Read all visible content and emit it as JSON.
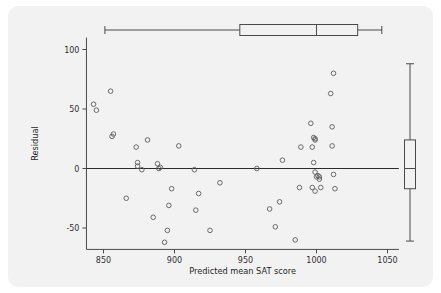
{
  "figure": {
    "background_color": "#f2f2f2",
    "page_color": "#ffffff",
    "point_color": "#5c5c5c",
    "axis_color": "#4a4a4a"
  },
  "chart_data": {
    "type": "scatter",
    "title": "",
    "xlabel": "Predicted mean SAT score",
    "ylabel": "Residual",
    "xlim": [
      838,
      1058
    ],
    "ylim": [
      -68,
      110
    ],
    "xticks": [
      850,
      900,
      950,
      1000,
      1050
    ],
    "xtick_labels": [
      "850",
      "900",
      "950",
      "1000",
      "1050"
    ],
    "yticks": [
      100,
      50,
      0,
      -50
    ],
    "ytick_labels": [
      "100",
      "50",
      "0",
      "-50"
    ],
    "grid": false,
    "legend": null,
    "reference_line_y": 0,
    "points": [
      [
        843,
        54
      ],
      [
        845,
        49
      ],
      [
        855,
        65
      ],
      [
        856,
        27
      ],
      [
        857,
        29
      ],
      [
        866,
        -25
      ],
      [
        873,
        18
      ],
      [
        874,
        5
      ],
      [
        874,
        2
      ],
      [
        877,
        -1
      ],
      [
        881,
        24
      ],
      [
        885,
        -41
      ],
      [
        888,
        4
      ],
      [
        889,
        0
      ],
      [
        890,
        1
      ],
      [
        893,
        -62
      ],
      [
        895,
        -52
      ],
      [
        896,
        -31
      ],
      [
        898,
        -17
      ],
      [
        903,
        19
      ],
      [
        914,
        -1
      ],
      [
        915,
        -35
      ],
      [
        917,
        -21
      ],
      [
        925,
        -52
      ],
      [
        932,
        -12
      ],
      [
        958,
        0
      ],
      [
        967,
        -34
      ],
      [
        971,
        -49
      ],
      [
        974,
        -28
      ],
      [
        976,
        7
      ],
      [
        985,
        -60
      ],
      [
        988,
        -16
      ],
      [
        989,
        18
      ],
      [
        996,
        38
      ],
      [
        997,
        18
      ],
      [
        997,
        -16
      ],
      [
        998,
        26
      ],
      [
        998,
        5
      ],
      [
        999,
        25
      ],
      [
        999,
        24
      ],
      [
        999,
        -3
      ],
      [
        999,
        -19
      ],
      [
        1000,
        -7
      ],
      [
        1001,
        -6
      ],
      [
        1002,
        -9
      ],
      [
        1002,
        -7
      ],
      [
        1003,
        -16
      ],
      [
        1010,
        63
      ],
      [
        1011,
        35
      ],
      [
        1011,
        19
      ],
      [
        1012,
        80
      ],
      [
        1012,
        -5
      ],
      [
        1013,
        -17
      ]
    ],
    "top_boxplot": {
      "orientation": "horizontal",
      "whisker_low": 851,
      "q1": 946,
      "median": 1000,
      "q3": 1029,
      "whisker_high": 1046
    },
    "right_boxplot": {
      "orientation": "vertical",
      "whisker_low": -61,
      "q1": -17,
      "median": 0,
      "q3": 24,
      "whisker_high": 88
    }
  }
}
